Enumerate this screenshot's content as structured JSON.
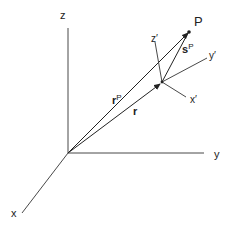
{
  "diagram": {
    "type": "coordinate-frame-vectors",
    "colors": {
      "line": "#333333",
      "text": "#222222",
      "background": "#ffffff"
    },
    "global_axes": {
      "x_label": "x",
      "y_label": "y",
      "z_label": "z"
    },
    "local_axes": {
      "x_label": "x′",
      "y_label": "y′",
      "z_label": "z′"
    },
    "point": {
      "label": "P"
    },
    "vectors": {
      "r": {
        "label": "r",
        "superscript": ""
      },
      "rP": {
        "label": "r",
        "superscript": "P"
      },
      "sP": {
        "label": "s",
        "superscript": "P"
      }
    }
  }
}
